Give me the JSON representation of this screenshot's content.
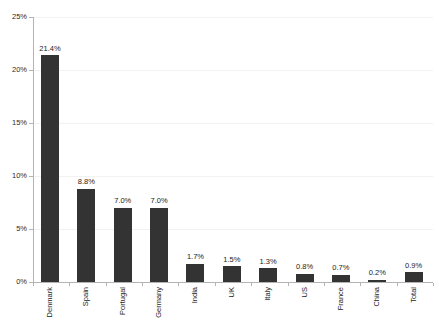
{
  "chart_data": {
    "type": "bar",
    "title": "",
    "subtitle": "",
    "xlabel": "",
    "ylabel": "",
    "ylim": [
      0,
      25
    ],
    "y_unit": "%",
    "grid": true,
    "legend": "none",
    "y_ticks": [
      "0%",
      "5%",
      "10%",
      "15%",
      "20%",
      "25%"
    ],
    "y_tick_values": [
      0,
      5,
      10,
      15,
      20,
      25
    ],
    "categories": [
      "Denmark",
      "Spain",
      "Portugal",
      "Germany",
      "India",
      "UK",
      "Italy",
      "US",
      "France",
      "China",
      "Total"
    ],
    "values": [
      21.4,
      8.8,
      7.0,
      7.0,
      1.7,
      1.5,
      1.3,
      0.8,
      0.7,
      0.2,
      0.9
    ],
    "data_labels": [
      "21.4%",
      "8.8%",
      "7.0%",
      "7.0%",
      "1.7%",
      "1.5%",
      "1.3%",
      "0.8%",
      "0.7%",
      "0.2%",
      "0.9%"
    ],
    "bar_color": "#333333",
    "gridline_color": "#f2f2f2",
    "axis_color": "#b4b4b4",
    "background": "#ffffff"
  }
}
